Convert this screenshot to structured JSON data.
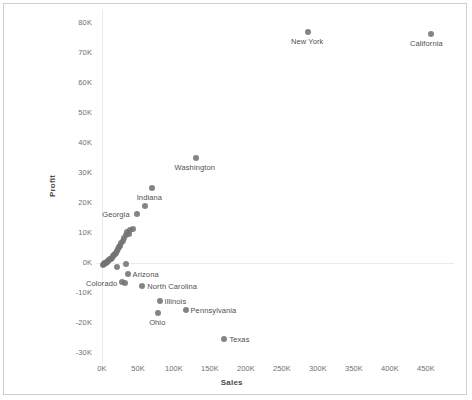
{
  "chart_data": {
    "type": "scatter",
    "title": "",
    "xlabel": "Sales",
    "ylabel": "Profit",
    "xlim": [
      -15000,
      490000
    ],
    "ylim": [
      -34000,
      84000
    ],
    "xticks": [
      "0K",
      "50K",
      "100K",
      "150K",
      "200K",
      "250K",
      "300K",
      "350K",
      "400K",
      "450K"
    ],
    "xtick_values": [
      0,
      50000,
      100000,
      150000,
      200000,
      250000,
      300000,
      350000,
      400000,
      450000
    ],
    "yticks": [
      "80K",
      "70K",
      "60K",
      "50K",
      "40K",
      "30K",
      "20K",
      "10K",
      "0K",
      "-10K",
      "-20K",
      "-30K"
    ],
    "ytick_values": [
      80000,
      70000,
      60000,
      50000,
      40000,
      30000,
      20000,
      10000,
      0,
      -10000,
      -20000,
      -30000
    ],
    "grid": true,
    "legend": "none",
    "marker_color": "#737373",
    "marker_size": 6,
    "points": [
      {
        "label": "California",
        "x": 457000,
        "y": 76400,
        "label_pos": "below"
      },
      {
        "label": "New York",
        "x": 286000,
        "y": 77000,
        "label_pos": "below"
      },
      {
        "label": "Washington",
        "x": 130000,
        "y": 35000,
        "label_pos": "below"
      },
      {
        "label": "Indiana",
        "x": 69000,
        "y": 25000,
        "label_pos": "below"
      },
      {
        "label": "Georgia",
        "x": 49000,
        "y": 16200,
        "label_pos": "left"
      },
      {
        "label": "Arizona",
        "x": 35500,
        "y": -3800,
        "label_pos": "right"
      },
      {
        "label": "Colorado",
        "x": 32000,
        "y": -6500,
        "label_pos": "left"
      },
      {
        "label": "North Carolina",
        "x": 56000,
        "y": -7500,
        "label_pos": "right"
      },
      {
        "label": "Illinois",
        "x": 80000,
        "y": -12500,
        "label_pos": "right"
      },
      {
        "label": "Pennsylvania",
        "x": 116000,
        "y": -15500,
        "label_pos": "right"
      },
      {
        "label": "Ohio",
        "x": 78000,
        "y": -16800,
        "label_pos": "below"
      },
      {
        "label": "Texas",
        "x": 170000,
        "y": -25300,
        "label_pos": "right"
      },
      {
        "label": "",
        "x": 60000,
        "y": 19000,
        "label_pos": "none"
      },
      {
        "label": "",
        "x": 43000,
        "y": 11500,
        "label_pos": "none"
      },
      {
        "label": "",
        "x": 39500,
        "y": 11000,
        "label_pos": "none"
      },
      {
        "label": "",
        "x": 37000,
        "y": 9800,
        "label_pos": "none"
      },
      {
        "label": "",
        "x": 35000,
        "y": 10400,
        "label_pos": "none"
      },
      {
        "label": "",
        "x": 33000,
        "y": 9200,
        "label_pos": "none"
      },
      {
        "label": "",
        "x": 31000,
        "y": 8200,
        "label_pos": "none"
      },
      {
        "label": "",
        "x": 29500,
        "y": 7200,
        "label_pos": "none"
      },
      {
        "label": "",
        "x": 27000,
        "y": 6600,
        "label_pos": "none"
      },
      {
        "label": "",
        "x": 25500,
        "y": 5800,
        "label_pos": "none"
      },
      {
        "label": "",
        "x": 24000,
        "y": 5200,
        "label_pos": "none"
      },
      {
        "label": "",
        "x": 22500,
        "y": 4600,
        "label_pos": "none"
      },
      {
        "label": "",
        "x": 21000,
        "y": 4000,
        "label_pos": "none"
      },
      {
        "label": "",
        "x": 19500,
        "y": 3500,
        "label_pos": "none"
      },
      {
        "label": "",
        "x": 18000,
        "y": 3000,
        "label_pos": "none"
      },
      {
        "label": "",
        "x": 16500,
        "y": 2600,
        "label_pos": "none"
      },
      {
        "label": "",
        "x": 15000,
        "y": 2200,
        "label_pos": "none"
      },
      {
        "label": "",
        "x": 13500,
        "y": 1800,
        "label_pos": "none"
      },
      {
        "label": "",
        "x": 12000,
        "y": 1500,
        "label_pos": "none"
      },
      {
        "label": "",
        "x": 10500,
        "y": 1200,
        "label_pos": "none"
      },
      {
        "label": "",
        "x": 9500,
        "y": 900,
        "label_pos": "none"
      },
      {
        "label": "",
        "x": 8500,
        "y": 650,
        "label_pos": "none"
      },
      {
        "label": "",
        "x": 7500,
        "y": 450,
        "label_pos": "none"
      },
      {
        "label": "",
        "x": 6500,
        "y": 250,
        "label_pos": "none"
      },
      {
        "label": "",
        "x": 5500,
        "y": 100,
        "label_pos": "none"
      },
      {
        "label": "",
        "x": 4500,
        "y": 0,
        "label_pos": "none"
      },
      {
        "label": "",
        "x": 3500,
        "y": -150,
        "label_pos": "none"
      },
      {
        "label": "",
        "x": 2800,
        "y": -300,
        "label_pos": "none"
      },
      {
        "label": "",
        "x": 2200,
        "y": -450,
        "label_pos": "none"
      },
      {
        "label": "",
        "x": 1600,
        "y": -600,
        "label_pos": "none"
      },
      {
        "label": "",
        "x": 20500,
        "y": -1200,
        "label_pos": "none"
      },
      {
        "label": "",
        "x": 34000,
        "y": -400,
        "label_pos": "none"
      },
      {
        "label": "",
        "x": 28000,
        "y": -6200,
        "label_pos": "none"
      }
    ]
  }
}
